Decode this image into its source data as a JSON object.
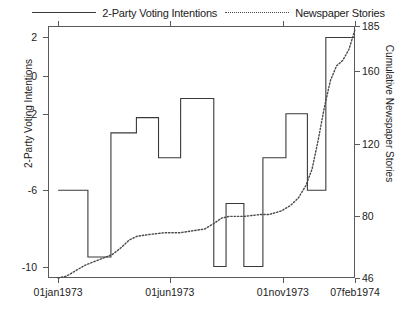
{
  "legend": {
    "entries": [
      {
        "label": "2-Party Voting Intentions",
        "key": "solid-line-key",
        "color": "#3a3a3a"
      },
      {
        "label": "Newspaper Stories",
        "key": "dotted-line-key",
        "color": "#4a4a4a"
      }
    ]
  },
  "axes": {
    "left_title": "2-Party Voting Intentions",
    "right_title": "Cumulative Newspaper Stories",
    "left_ticks": [
      "2",
      "0",
      "-2",
      "-6",
      "-10"
    ],
    "left_tick_values": [
      2,
      0,
      -2,
      -6,
      -10
    ],
    "right_ticks": [
      "185",
      "160",
      "120",
      "80",
      "46"
    ],
    "right_tick_values": [
      185,
      160,
      120,
      80,
      46
    ],
    "x_ticks": [
      "01jan1973",
      "01jun1973",
      "01nov1973",
      "07feb1974"
    ],
    "x_tick_positions": [
      0.033,
      0.397,
      0.765,
      1.0
    ]
  },
  "chart_data": {
    "type": "line",
    "title": "",
    "xlabel": "",
    "ylabel": "2-Party Voting Intentions",
    "y2label": "Cumulative Newspaper Stories",
    "xlim": [
      "01jan1973",
      "07feb1974"
    ],
    "ylim": [
      -10.6,
      2.6
    ],
    "y2lim": [
      46,
      185
    ],
    "grid": false,
    "legend_position": "top",
    "series": [
      {
        "name": "2-Party Voting Intentions",
        "axis": "left",
        "style": "step",
        "linestyle": "solid",
        "color": "#3a3a3a",
        "points": [
          {
            "x": 0.033,
            "y": -6.0
          },
          {
            "x": 0.13,
            "y": -6.0
          },
          {
            "x": 0.13,
            "y": -9.5
          },
          {
            "x": 0.205,
            "y": -9.5
          },
          {
            "x": 0.205,
            "y": -3.0
          },
          {
            "x": 0.288,
            "y": -3.0
          },
          {
            "x": 0.288,
            "y": -2.2
          },
          {
            "x": 0.36,
            "y": -2.2
          },
          {
            "x": 0.36,
            "y": -4.3
          },
          {
            "x": 0.432,
            "y": -4.3
          },
          {
            "x": 0.432,
            "y": -1.2
          },
          {
            "x": 0.54,
            "y": -1.2
          },
          {
            "x": 0.54,
            "y": -10.0
          },
          {
            "x": 0.58,
            "y": -10.0
          },
          {
            "x": 0.58,
            "y": -6.7
          },
          {
            "x": 0.638,
            "y": -6.7
          },
          {
            "x": 0.638,
            "y": -10.0
          },
          {
            "x": 0.7,
            "y": -10.0
          },
          {
            "x": 0.7,
            "y": -4.3
          },
          {
            "x": 0.775,
            "y": -4.3
          },
          {
            "x": 0.775,
            "y": -2.0
          },
          {
            "x": 0.845,
            "y": -2.0
          },
          {
            "x": 0.845,
            "y": -6.0
          },
          {
            "x": 0.905,
            "y": -6.0
          },
          {
            "x": 0.905,
            "y": 2.0
          },
          {
            "x": 1.0,
            "y": 2.0
          }
        ]
      },
      {
        "name": "Newspaper Stories",
        "axis": "right",
        "style": "line",
        "linestyle": "dotted",
        "color": "#4a4a4a",
        "points": [
          {
            "x": 0.033,
            "y": 46
          },
          {
            "x": 0.06,
            "y": 47
          },
          {
            "x": 0.09,
            "y": 50
          },
          {
            "x": 0.12,
            "y": 53
          },
          {
            "x": 0.15,
            "y": 55
          },
          {
            "x": 0.18,
            "y": 57
          },
          {
            "x": 0.21,
            "y": 59
          },
          {
            "x": 0.24,
            "y": 63
          },
          {
            "x": 0.265,
            "y": 67
          },
          {
            "x": 0.29,
            "y": 69
          },
          {
            "x": 0.33,
            "y": 70
          },
          {
            "x": 0.38,
            "y": 71
          },
          {
            "x": 0.43,
            "y": 71
          },
          {
            "x": 0.47,
            "y": 72
          },
          {
            "x": 0.51,
            "y": 73
          },
          {
            "x": 0.54,
            "y": 76
          },
          {
            "x": 0.565,
            "y": 79
          },
          {
            "x": 0.59,
            "y": 80
          },
          {
            "x": 0.64,
            "y": 80
          },
          {
            "x": 0.69,
            "y": 81
          },
          {
            "x": 0.72,
            "y": 81
          },
          {
            "x": 0.76,
            "y": 83
          },
          {
            "x": 0.79,
            "y": 86
          },
          {
            "x": 0.815,
            "y": 90
          },
          {
            "x": 0.84,
            "y": 97
          },
          {
            "x": 0.86,
            "y": 106
          },
          {
            "x": 0.88,
            "y": 122
          },
          {
            "x": 0.9,
            "y": 140
          },
          {
            "x": 0.92,
            "y": 155
          },
          {
            "x": 0.94,
            "y": 163
          },
          {
            "x": 0.96,
            "y": 166
          },
          {
            "x": 0.98,
            "y": 172
          },
          {
            "x": 1.0,
            "y": 183
          }
        ]
      }
    ]
  }
}
